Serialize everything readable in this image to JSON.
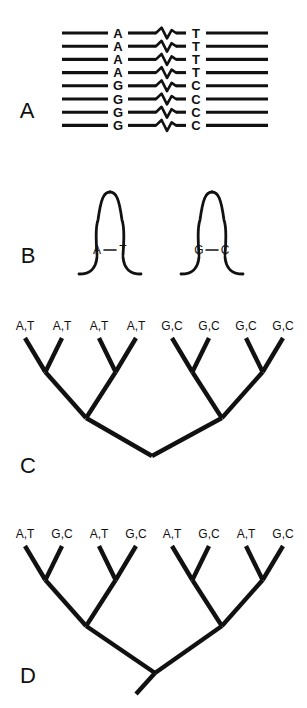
{
  "figure": {
    "width": 307,
    "height": 708,
    "background": "#ffffff",
    "ink": "#111111"
  },
  "panels": {
    "a": {
      "letter": "A",
      "letter_x": 27,
      "letter_y": 118,
      "caption_role": "aligned-sequences-with-break",
      "left_base_x": 118,
      "right_base_x": 196,
      "line_left_start": 62,
      "line_left_end": 108,
      "line_mid_start": 128,
      "line_mid_end": 156,
      "line_mid2_start": 176,
      "line_mid2_end": 186,
      "line_right_start": 206,
      "line_right_end": 268,
      "squiggle_x0": 156,
      "squiggle_x1": 176,
      "first_row_y": 33,
      "row_spacing": 13.2,
      "rows": [
        {
          "left": "A",
          "right": "T"
        },
        {
          "left": "A",
          "right": "T"
        },
        {
          "left": "A",
          "right": "T"
        },
        {
          "left": "A",
          "right": "T"
        },
        {
          "left": "G",
          "right": "C"
        },
        {
          "left": "G",
          "right": "C"
        },
        {
          "left": "G",
          "right": "C"
        },
        {
          "left": "G",
          "right": "C"
        }
      ]
    },
    "b": {
      "letter": "B",
      "letter_x": 28,
      "letter_y": 263,
      "caption_role": "rna-stem-loop-hairpins",
      "hairpins": [
        {
          "name": "hairpin-at",
          "center_x": 110,
          "left_base": "A",
          "right_base": "T",
          "pair_y": 250
        },
        {
          "name": "hairpin-gc",
          "center_x": 212,
          "left_base": "G",
          "right_base": "C",
          "pair_y": 250
        }
      ]
    },
    "c": {
      "letter": "C",
      "letter_x": 28,
      "letter_y": 473,
      "caption_role": "cladogram-clustered-states",
      "tip_label_y": 330,
      "tips": [
        {
          "label": "A,T",
          "x": 25
        },
        {
          "label": "A,T",
          "x": 62
        },
        {
          "label": "A,T",
          "x": 99
        },
        {
          "label": "A,T",
          "x": 136
        },
        {
          "label": "G,C",
          "x": 172
        },
        {
          "label": "G,C",
          "x": 209
        },
        {
          "label": "G,C",
          "x": 246
        },
        {
          "label": "G,C",
          "x": 283
        }
      ],
      "root_x": 152,
      "root_y": 456,
      "tip_top_y": 338
    },
    "d": {
      "letter": "D",
      "letter_x": 28,
      "letter_y": 683,
      "caption_role": "cladogram-alternating-states",
      "tip_label_y": 538,
      "tips": [
        {
          "label": "A,T",
          "x": 25
        },
        {
          "label": "G,C",
          "x": 62
        },
        {
          "label": "A,T",
          "x": 99
        },
        {
          "label": "G,C",
          "x": 136
        },
        {
          "label": "A,T",
          "x": 172
        },
        {
          "label": "G,C",
          "x": 209
        },
        {
          "label": "A,T",
          "x": 246
        },
        {
          "label": "G,C",
          "x": 283
        }
      ],
      "root_x": 155,
      "root_y": 673,
      "root_stem_x": 136,
      "root_stem_y": 694,
      "tip_top_y": 546
    }
  }
}
